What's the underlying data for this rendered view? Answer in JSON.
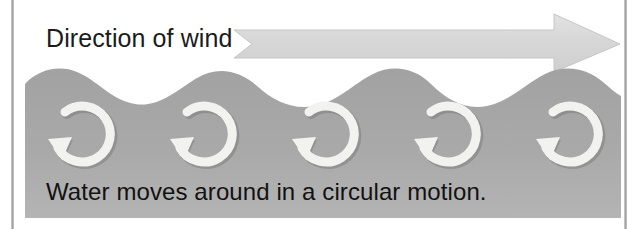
{
  "figure": {
    "name": "ocean-wave-circular-motion-diagram",
    "width": 637,
    "height": 229,
    "background_color": "#ffffff"
  },
  "wind": {
    "label": "Direction of wind",
    "label_color": "#1b1b1b",
    "arrow_icon": "right-arrow-icon",
    "arrow_direction": "right",
    "arrow_fill": "#d9d9d9",
    "arrow_stroke": "#c4c4c4"
  },
  "water": {
    "caption": "Water moves around in a circular motion.",
    "caption_color": "#121212",
    "fill_color": "#a8a8a8",
    "wave_crest_count": 5,
    "eddy_icon": "circular-arrow-icon",
    "eddy_count": 5,
    "eddy_rotation": "counterclockwise",
    "eddy_fill": "#f0f0ee",
    "eddy_shadow": "#7e7e7e"
  },
  "frame": {
    "rule_color": "#a0a0a0",
    "left_rule_x": 11,
    "right_rule_x": 624
  }
}
